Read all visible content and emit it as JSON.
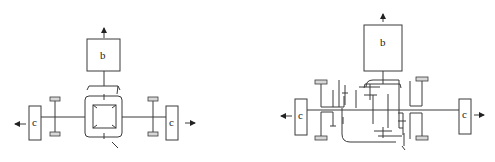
{
  "diagram": {
    "left": {
      "top_box_label": "b",
      "left_box_label": "c",
      "right_box_label": "c"
    },
    "right": {
      "top_box_label": "b",
      "left_box_label": "c",
      "right_box_label": "c"
    },
    "colors": {
      "line": "#3a3a3a",
      "background": "#ffffff"
    }
  }
}
